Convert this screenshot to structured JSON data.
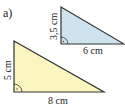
{
  "label": "a)",
  "triangle_blue": {
    "fill": "#cfe3ef",
    "height_label": "3,5 cm",
    "base_label": "6 cm"
  },
  "triangle_yellow": {
    "fill": "#fbf5bf",
    "height_label": "5 cm",
    "base_label": "8 cm"
  }
}
